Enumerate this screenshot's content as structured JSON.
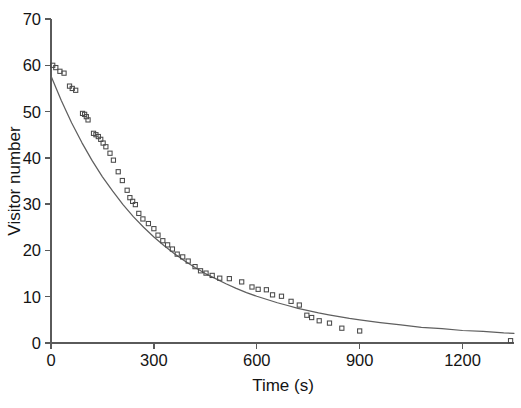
{
  "chart_data": {
    "type": "scatter",
    "title": "",
    "subtitle": "",
    "xlabel": "Time (s)",
    "ylabel": "Visitor number",
    "xlim": [
      0,
      1350
    ],
    "ylim": [
      0,
      70
    ],
    "xticks": [
      0,
      300,
      600,
      900,
      1200
    ],
    "yticks": [
      0,
      10,
      20,
      30,
      40,
      50,
      60,
      70
    ],
    "grid": false,
    "legend": false,
    "legend_position": "none",
    "marker_style": "open-square",
    "marker_color": "#4a4a4a",
    "curve_color": "#5f5f5f",
    "axis_color": "#5a5a5a",
    "annotations": [],
    "series": [
      {
        "name": "Visitor number observations",
        "type": "scatter",
        "points": [
          [
            5,
            60.0
          ],
          [
            14,
            59.5
          ],
          [
            26,
            58.7
          ],
          [
            38,
            58.3
          ],
          [
            54,
            55.5
          ],
          [
            62,
            55.0
          ],
          [
            72,
            54.6
          ],
          [
            92,
            49.6
          ],
          [
            98,
            49.4
          ],
          [
            103,
            48.9
          ],
          [
            108,
            48.2
          ],
          [
            124,
            45.3
          ],
          [
            131,
            45.0
          ],
          [
            138,
            44.6
          ],
          [
            145,
            44.0
          ],
          [
            152,
            43.2
          ],
          [
            160,
            42.4
          ],
          [
            172,
            41.0
          ],
          [
            182,
            39.5
          ],
          [
            196,
            37.0
          ],
          [
            208,
            35.1
          ],
          [
            222,
            33.0
          ],
          [
            230,
            31.4
          ],
          [
            238,
            30.6
          ],
          [
            246,
            29.9
          ],
          [
            256,
            28.0
          ],
          [
            268,
            26.8
          ],
          [
            284,
            25.8
          ],
          [
            300,
            24.7
          ],
          [
            312,
            23.3
          ],
          [
            326,
            22.1
          ],
          [
            340,
            21.2
          ],
          [
            354,
            20.3
          ],
          [
            368,
            19.2
          ],
          [
            384,
            18.6
          ],
          [
            400,
            17.7
          ],
          [
            420,
            16.5
          ],
          [
            436,
            15.6
          ],
          [
            452,
            15.1
          ],
          [
            470,
            14.6
          ],
          [
            492,
            14.0
          ],
          [
            520,
            13.9
          ],
          [
            556,
            13.2
          ],
          [
            586,
            12.1
          ],
          [
            604,
            11.6
          ],
          [
            628,
            11.5
          ],
          [
            646,
            10.4
          ],
          [
            672,
            10.1
          ],
          [
            700,
            9.0
          ],
          [
            724,
            8.2
          ],
          [
            746,
            6.0
          ],
          [
            760,
            5.5
          ],
          [
            782,
            4.8
          ],
          [
            812,
            4.3
          ],
          [
            848,
            3.2
          ],
          [
            900,
            2.6
          ],
          [
            1340,
            0.5
          ]
        ]
      },
      {
        "name": "Exponential fit",
        "type": "line",
        "model": "exponential decay",
        "y0": 57.7,
        "decay_constant_s": 295,
        "offset": 0.35,
        "points": [
          [
            0,
            57.7
          ],
          [
            30,
            52.4
          ],
          [
            60,
            47.6
          ],
          [
            90,
            43.3
          ],
          [
            120,
            39.4
          ],
          [
            150,
            35.9
          ],
          [
            180,
            32.8
          ],
          [
            210,
            29.9
          ],
          [
            240,
            27.3
          ],
          [
            270,
            25.0
          ],
          [
            300,
            22.9
          ],
          [
            330,
            21.0
          ],
          [
            360,
            19.3
          ],
          [
            390,
            17.7
          ],
          [
            420,
            16.3
          ],
          [
            450,
            15.0
          ],
          [
            480,
            13.9
          ],
          [
            510,
            12.8
          ],
          [
            540,
            11.8
          ],
          [
            570,
            10.9
          ],
          [
            600,
            10.1
          ],
          [
            630,
            9.4
          ],
          [
            660,
            8.7
          ],
          [
            690,
            8.1
          ],
          [
            720,
            7.5
          ],
          [
            750,
            7.0
          ],
          [
            780,
            6.5
          ],
          [
            810,
            6.1
          ],
          [
            840,
            5.7
          ],
          [
            870,
            5.3
          ],
          [
            900,
            5.0
          ],
          [
            960,
            4.4
          ],
          [
            1020,
            3.9
          ],
          [
            1080,
            3.4
          ],
          [
            1140,
            3.1
          ],
          [
            1200,
            2.7
          ],
          [
            1260,
            2.5
          ],
          [
            1320,
            2.2
          ],
          [
            1350,
            2.1
          ]
        ]
      }
    ]
  },
  "axes": {
    "y_title": "Visitor number",
    "x_title": "Time (s)",
    "y_tick_labels": [
      "0",
      "10",
      "20",
      "30",
      "40",
      "50",
      "60",
      "70"
    ],
    "x_tick_labels": [
      "0",
      "300",
      "600",
      "900",
      "1200"
    ]
  }
}
